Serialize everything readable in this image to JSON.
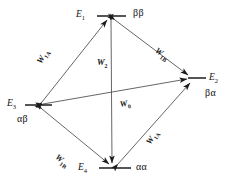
{
  "figure": {
    "type": "state-transition-diagram",
    "background_color": "#ffffff",
    "line_color": "#3d3d3d",
    "text_color": "#111111"
  },
  "nodes": [
    {
      "id": "E1",
      "state_label": "E",
      "state_sub": "1",
      "spin_label": "ββ",
      "x": 111,
      "y": 16,
      "level_line": true
    },
    {
      "id": "E2",
      "state_label": "E",
      "state_sub": "2",
      "spin_label": "βα",
      "x": 192,
      "y": 78,
      "level_line": true
    },
    {
      "id": "E3",
      "state_label": "E",
      "state_sub": "3",
      "spin_label": "αβ",
      "x": 38,
      "y": 105,
      "level_line": true
    },
    {
      "id": "E4",
      "state_label": "E",
      "state_sub": "4",
      "spin_label": "αα",
      "x": 113,
      "y": 168,
      "level_line": true
    }
  ],
  "edges": [
    {
      "id": "edge-E3-E1",
      "from": "E3",
      "to": "E1",
      "label": "W",
      "label_sub": "1A",
      "arrows": "both"
    },
    {
      "id": "edge-E1-E2",
      "from": "E1",
      "to": "E2",
      "label": "W",
      "label_sub": "1B",
      "arrows": "both"
    },
    {
      "id": "edge-E1-E4",
      "from": "E1",
      "to": "E4",
      "label": "W",
      "label_sub": "2",
      "arrows": "both"
    },
    {
      "id": "edge-E3-E2",
      "from": "E3",
      "to": "E2",
      "label": "W",
      "label_sub": "0",
      "arrows": "both"
    },
    {
      "id": "edge-E3-E4",
      "from": "E3",
      "to": "E4",
      "label": "W",
      "label_sub": "1B",
      "arrows": "both"
    },
    {
      "id": "edge-E4-E2",
      "from": "E4",
      "to": "E2",
      "label": "W",
      "label_sub": "1A",
      "arrows": "both"
    }
  ],
  "labels": {
    "e1_state": "E",
    "e1_sub": "1",
    "e1_spin": "ββ",
    "e2_state": "E",
    "e2_sub": "2",
    "e2_spin": "βα",
    "e3_state": "E",
    "e3_sub": "3",
    "e3_spin": "αβ",
    "e4_state": "E",
    "e4_sub": "4",
    "e4_spin": "αα",
    "w1a_upper": "W",
    "w1a_upper_sub": "1A",
    "w1b_upper": "W",
    "w1b_upper_sub": "1B",
    "w2": "W",
    "w2_sub": "2",
    "w0": "W",
    "w0_sub": "0",
    "w1b_lower": "W",
    "w1b_lower_sub": "1B",
    "w1a_lower": "W",
    "w1a_lower_sub": "1A"
  }
}
